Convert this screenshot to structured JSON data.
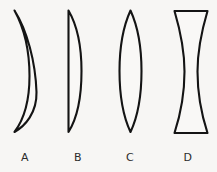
{
  "figure": {
    "background_color": "#f7f6f4",
    "stroke_color": "#141414",
    "fill_color": "#f9f8f6",
    "label_color": "#2b2b2b"
  },
  "lenses": [
    {
      "id": "lens-a",
      "label": "A",
      "shape": "meniscus",
      "description": "concavo-convex crescent, both surfaces curve the same direction",
      "label_x": 25,
      "label_y": 161,
      "path": "M 14.5 10.5 C 27 30 35.5 62 36.5 92 C 37 113 25 126 14.5 132 C 23.5 120 29.5 100 29.5 76 C 29.5 48 23 26 14.5 10.5 Z"
    },
    {
      "id": "lens-b",
      "label": "B",
      "shape": "plano-convex",
      "description": "flat left surface, convex right surface",
      "label_x": 78,
      "label_y": 161,
      "path": "M 68.5 10.5 L 68.5 132 C 78 117 81.5 94 81.5 71 C 81.5 47 77.5 26 68.5 10.5 Z"
    },
    {
      "id": "lens-c",
      "label": "C",
      "shape": "biconvex",
      "description": "both surfaces convex, pointed apexes top and bottom",
      "label_x": 130,
      "label_y": 161,
      "path": "M 130.5 10.5 C 122.5 28 119.5 48 119.5 71 C 119.5 94 122.5 115 130.5 132 C 138.5 115 141.5 94 141.5 71 C 141.5 48 138.5 28 130.5 10.5 Z"
    },
    {
      "id": "lens-d",
      "label": "D",
      "shape": "biconcave",
      "description": "both surfaces concave, flat top and bottom edges",
      "label_x": 188,
      "label_y": 161,
      "path": "M 174.5 11 L 207.5 11 C 201 33 197.5 52 197.5 71.5 C 197.5 92 201 113 207.5 133 L 174.5 133 C 181 113 184.5 92 184.5 71.5 C 184.5 52 181 33 174.5 11 Z"
    }
  ]
}
